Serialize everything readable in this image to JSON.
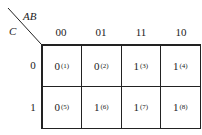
{
  "kmap": {
    "row_var": "C",
    "col_var": "AB",
    "col_headers": [
      "00",
      "01",
      "11",
      "10"
    ],
    "row_headers": [
      "0",
      "1"
    ],
    "cells": [
      [
        {
          "value": "0",
          "index": "(1)"
        },
        {
          "value": "0",
          "index": "(2)"
        },
        {
          "value": "1",
          "index": "(3)"
        },
        {
          "value": "1",
          "index": "(4)"
        }
      ],
      [
        {
          "value": "0",
          "index": "(5)"
        },
        {
          "value": "1",
          "index": "(6)"
        },
        {
          "value": "1",
          "index": "(7)"
        },
        {
          "value": "1",
          "index": "(8)"
        }
      ]
    ]
  }
}
